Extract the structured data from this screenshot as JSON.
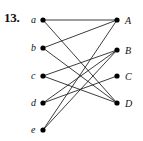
{
  "figure": {
    "number_label": "13.",
    "caption": "",
    "width": 143,
    "height": 141,
    "background_color": "#ffffff",
    "edge_color": "#1a1a1a",
    "vertex_color": "#000000",
    "label_color": "#111111"
  },
  "graph": {
    "type": "bipartite",
    "left_part_name": "lowercase",
    "right_part_name": "uppercase",
    "left_vertices": [
      {
        "id": "a",
        "label": "a",
        "x": 43,
        "y": 20,
        "label_x": 31,
        "label_y": 23,
        "degree": 2
      },
      {
        "id": "b",
        "label": "b",
        "x": 43,
        "y": 48,
        "label_x": 31,
        "label_y": 51,
        "degree": 2
      },
      {
        "id": "c",
        "label": "c",
        "x": 43,
        "y": 76,
        "label_x": 31,
        "label_y": 79,
        "degree": 2
      },
      {
        "id": "d",
        "label": "d",
        "x": 43,
        "y": 103,
        "label_x": 31,
        "label_y": 106,
        "degree": 2
      },
      {
        "id": "e",
        "label": "e",
        "x": 43,
        "y": 130,
        "label_x": 31,
        "label_y": 133,
        "degree": 2
      }
    ],
    "right_vertices": [
      {
        "id": "A",
        "label": "A",
        "x": 117,
        "y": 20,
        "label_x": 125,
        "label_y": 24,
        "degree": 3
      },
      {
        "id": "B",
        "label": "B",
        "x": 117,
        "y": 50,
        "label_x": 125,
        "label_y": 54,
        "degree": 3
      },
      {
        "id": "C",
        "label": "C",
        "x": 117,
        "y": 76,
        "label_x": 125,
        "label_y": 80,
        "degree": 1
      },
      {
        "id": "D",
        "label": "D",
        "x": 117,
        "y": 103,
        "label_x": 125,
        "label_y": 107,
        "degree": 3
      }
    ],
    "edges": [
      {
        "from": "a",
        "to": "A"
      },
      {
        "from": "a",
        "to": "D"
      },
      {
        "from": "b",
        "to": "A"
      },
      {
        "from": "b",
        "to": "D"
      },
      {
        "from": "c",
        "to": "B"
      },
      {
        "from": "c",
        "to": "D"
      },
      {
        "from": "d",
        "to": "B"
      },
      {
        "from": "d",
        "to": "C"
      },
      {
        "from": "e",
        "to": "A"
      },
      {
        "from": "e",
        "to": "B"
      }
    ],
    "edge_count": 10,
    "vertex_count": 9
  }
}
